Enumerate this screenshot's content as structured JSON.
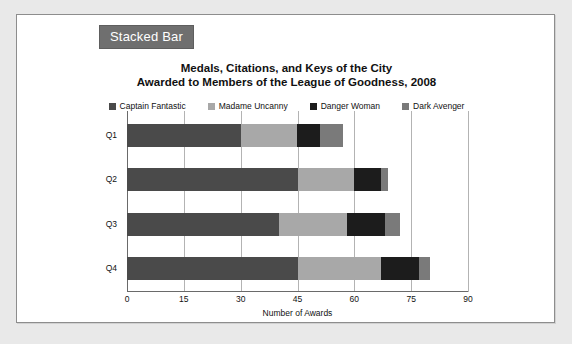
{
  "panel": {
    "badge_label": "Stacked Bar",
    "badge_bg": "#6f6f6f",
    "badge_text_color": "#ffffff",
    "card_bg": "#ffffff",
    "page_bg": "#e9e9e9"
  },
  "chart_data": {
    "type": "bar",
    "orientation": "horizontal",
    "stacked": true,
    "title": "Medals, Citations, and Keys of the City",
    "subtitle": "Awarded to Members of the League of Goodness, 2008",
    "title_lines": [
      "Medals, Citations, and Keys of the City",
      "Awarded to Members of the League of Goodness, 2008"
    ],
    "categories": [
      "Q1",
      "Q2",
      "Q3",
      "Q4"
    ],
    "series": [
      {
        "name": "Captain Fantastic",
        "color": "#4a4a4a",
        "values": [
          30,
          45,
          40,
          45
        ]
      },
      {
        "name": "Madame Uncanny",
        "color": "#a8a8a8",
        "values": [
          15,
          15,
          18,
          22
        ]
      },
      {
        "name": "Danger Woman",
        "color": "#1c1c1c",
        "values": [
          6,
          7,
          10,
          10
        ]
      },
      {
        "name": "Dark Avenger",
        "color": "#7a7a7a",
        "values": [
          6,
          2,
          4,
          3
        ]
      }
    ],
    "totals": [
      57,
      69,
      72,
      80
    ],
    "xlabel": "Number of Awards",
    "ylabel": "",
    "xticks": [
      0,
      15,
      30,
      45,
      60,
      75,
      90
    ],
    "xlim": [
      0,
      90
    ],
    "grid": true,
    "legend_position": "top"
  }
}
